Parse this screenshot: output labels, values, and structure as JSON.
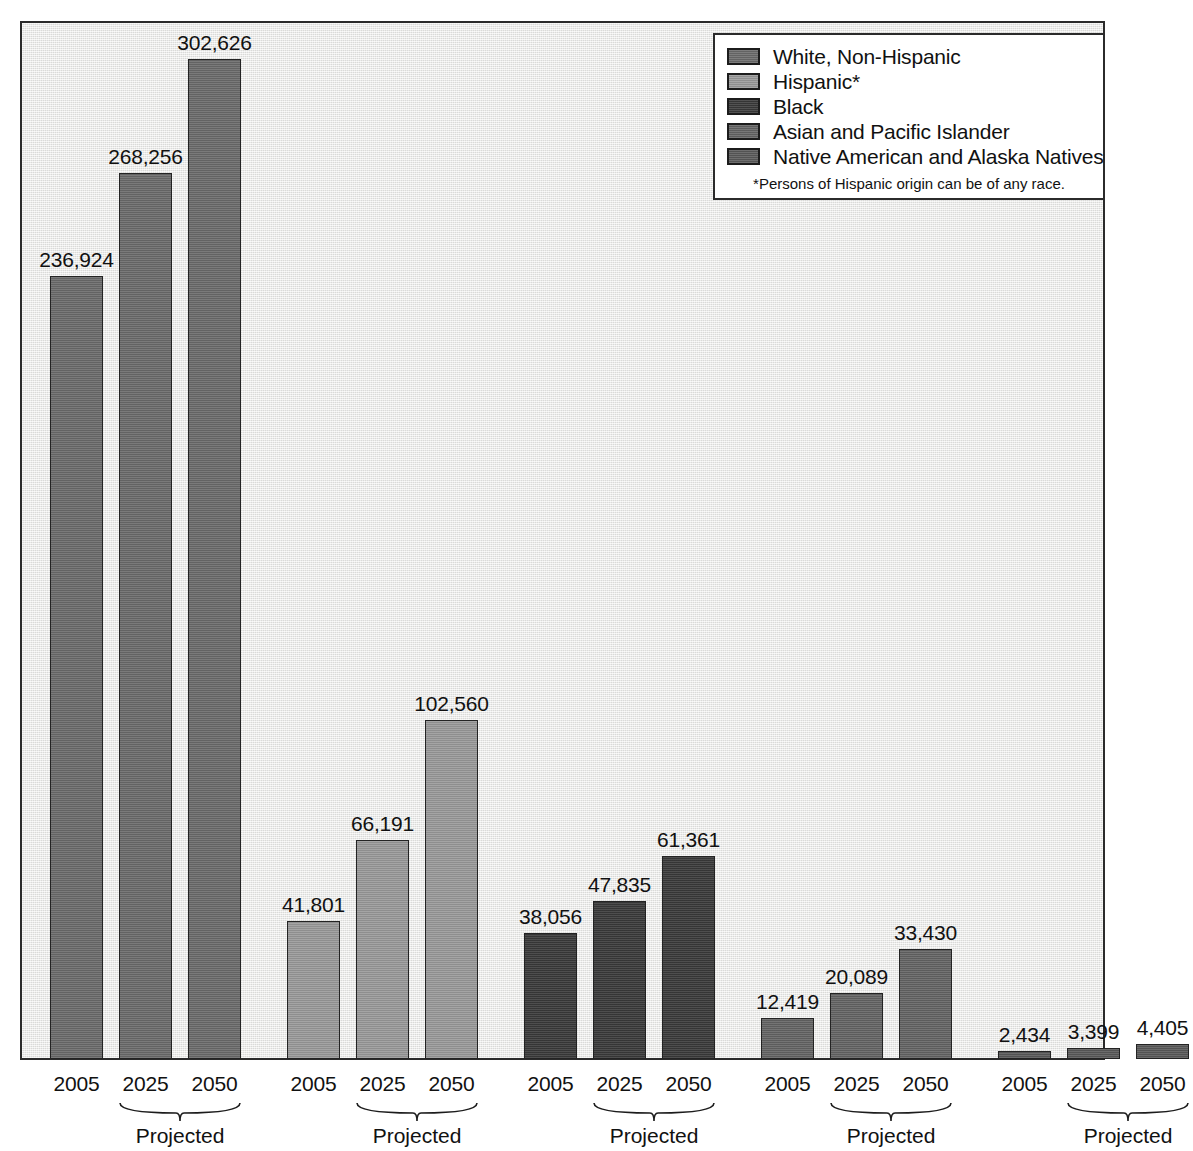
{
  "chart_data": {
    "type": "bar",
    "title": "",
    "subtitle": "",
    "xlabel": "",
    "ylabel": "",
    "ylim": [
      0,
      330000
    ],
    "grid": false,
    "legend_position": "top-right",
    "categories": [
      "2005",
      "2025",
      "2050"
    ],
    "group_note": "Projected",
    "series": [
      {
        "name": "White, Non-Hispanic",
        "color": "#6b6b6b",
        "values": [
          236924,
          268256,
          302626
        ],
        "labels": [
          "236,924",
          "268,256",
          "302,626"
        ]
      },
      {
        "name": "Hispanic*",
        "color": "#9a9a9a",
        "values": [
          41801,
          66191,
          102560
        ],
        "labels": [
          "41,801",
          "66,191",
          "102,560"
        ]
      },
      {
        "name": "Black",
        "color": "#3a3a3a",
        "values": [
          38056,
          47835,
          61361
        ],
        "labels": [
          "38,056",
          "47,835",
          "61,361"
        ]
      },
      {
        "name": "Asian and Pacific Islander",
        "color": "#646464",
        "values": [
          12419,
          20089,
          33430
        ],
        "labels": [
          "12,419",
          "20,089",
          "33,430"
        ]
      },
      {
        "name": "Native American and Alaska Natives",
        "color": "#5a5a5a",
        "values": [
          2434,
          3399,
          4405
        ],
        "labels": [
          "2,434",
          "3,399",
          "4,405"
        ]
      }
    ],
    "annotations": [
      "Projected",
      "Projected",
      "Projected",
      "Projected",
      "Projected"
    ]
  },
  "legend": {
    "items": [
      {
        "label": "White, Non-Hispanic",
        "color": "#6b6b6b"
      },
      {
        "label": "Hispanic*",
        "color": "#9a9a9a"
      },
      {
        "label": "Black",
        "color": "#3a3a3a"
      },
      {
        "label": "Asian and Pacific Islander",
        "color": "#646464"
      },
      {
        "label": "Native American and Alaska Natives",
        "color": "#5a5a5a"
      }
    ],
    "footnote": "*Persons of Hispanic origin can be of any race."
  },
  "axis": {
    "year_labels": [
      "2005",
      "2025",
      "2050",
      "2005",
      "2025",
      "2050",
      "2005",
      "2025",
      "2050",
      "2005",
      "2025",
      "2050",
      "2005",
      "2025",
      "2050"
    ],
    "projected_labels": [
      "Projected",
      "Projected",
      "Projected",
      "Projected",
      "Projected"
    ]
  },
  "caption": {
    "source": ""
  }
}
